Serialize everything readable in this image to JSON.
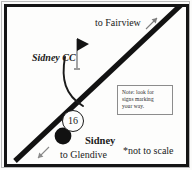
{
  "figure": {
    "scale_note": "*not to scale"
  },
  "map": {
    "highway_shield": {
      "route_number": "16",
      "icon": "highway-shield-circle-icon"
    },
    "city": {
      "name": "Sidney",
      "marker_icon": "filled-circle-city-marker-icon"
    },
    "directions": {
      "north_east": "to Fairview",
      "south_west": "to Glendive"
    },
    "poi": {
      "name": "Sidney CC",
      "icon": "golf-flag-icon"
    },
    "note": {
      "lines": [
        "Note: look for",
        "signs marking",
        "your way."
      ]
    },
    "arrows": {
      "fairview_arrow": "arrow-up-right-icon",
      "glendive_arrow": "arrow-down-left-icon"
    },
    "colors": {
      "road": "#121212",
      "frame": "#141414",
      "background": "#fdfdfc",
      "text": "#1b1b1b"
    }
  }
}
